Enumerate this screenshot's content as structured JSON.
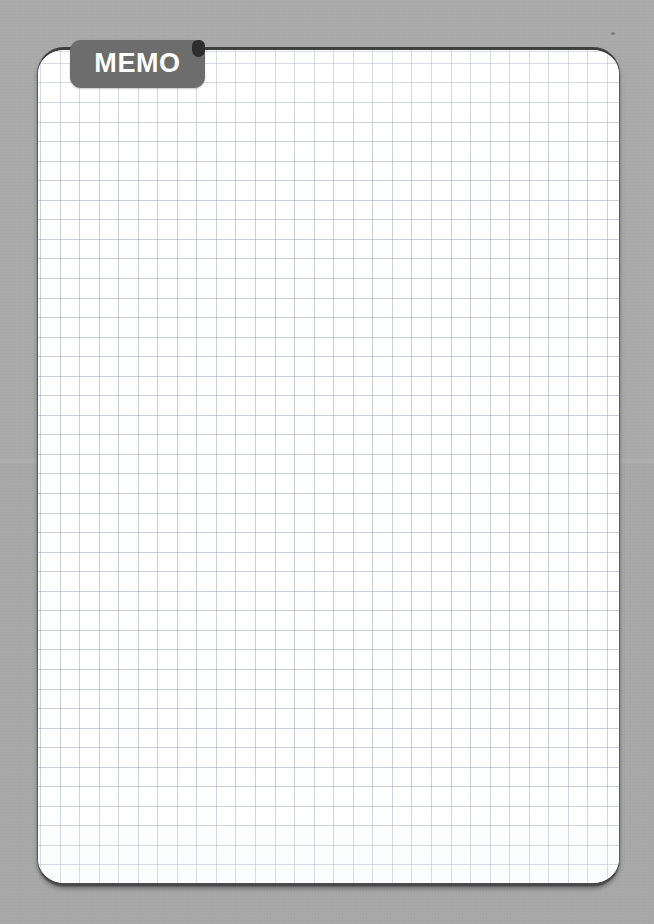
{
  "canvas": {
    "width": 654,
    "height": 924,
    "background_color": "#a7a7a7",
    "seam_y": 460
  },
  "memo_card": {
    "name": "memo-note-card",
    "paper_color": "#ffffff",
    "border_color": "#4a4a4a",
    "corner_radius_px": 27,
    "bounds": {
      "x": 37,
      "y": 47,
      "width": 583,
      "height": 839
    },
    "content_text": "",
    "content_placeholder": ""
  },
  "grid": {
    "type": "graph-paper",
    "cell_size_px": 19.5,
    "line_color": "#96a0af",
    "columns": 29,
    "rows": 42
  },
  "tab": {
    "label": "MEMO",
    "background_color": "#6d6d6d",
    "text_color": "#ffffff",
    "corner_dot_color": "#2e2e2e",
    "bounds": {
      "x": 70,
      "y": 40,
      "width": 135,
      "height": 48
    }
  }
}
